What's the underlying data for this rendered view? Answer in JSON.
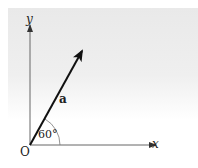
{
  "diagram": {
    "type": "vector-angle",
    "background": "light gray gradient panel",
    "origin_label": "O",
    "x_axis_label": "x",
    "y_axis_label": "y",
    "vector_label": "a",
    "angle_label": "60°",
    "angle_degrees": 60,
    "colors": {
      "axis": "#555555",
      "vector": "#111111",
      "arc": "#666666",
      "text": "#222222"
    }
  }
}
